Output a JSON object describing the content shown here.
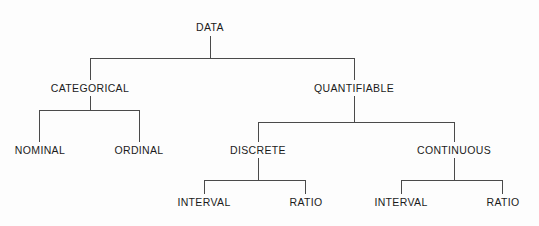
{
  "diagram": {
    "title": "DATA",
    "type": "hierarchy-tree",
    "orientation": "top-down",
    "levels": 4,
    "root": {
      "label": "DATA"
    },
    "nodes": {
      "root": "DATA",
      "categorical": "CATEGORICAL",
      "quantifiable": "QUANTIFIABLE",
      "nominal": "NOMINAL",
      "ordinal": "ORDINAL",
      "discrete": "DISCRETE",
      "continuous": "CONTINUOUS",
      "discrete_interval": "INTERVAL",
      "discrete_ratio": "RATIO",
      "continuous_interval": "INTERVAL",
      "continuous_ratio": "RATIO"
    },
    "colors": {
      "background": "#fdfdfd",
      "line": "#4a4a4a",
      "text": "#1b1b1b"
    }
  }
}
